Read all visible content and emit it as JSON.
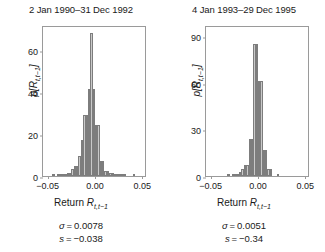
{
  "figure": {
    "background": "#ffffff",
    "bar_fill": "#c9c9c9",
    "bar_edge": "#7d7d7d",
    "axis_color": "#9a9a9a"
  },
  "panels": [
    {
      "title": "2 Jan 1990–31 Dec 1992",
      "ylabel_p": "p",
      "ylabel_r": "[R",
      "ylabel_sub": "t,t−1",
      "ylabel_close": "]",
      "xlabel_main": "Return ",
      "xlabel_r": "R",
      "xlabel_sub": "t,t−1",
      "sigma_line": "σ = 0.0078",
      "sigma_symbol": "σ",
      "sigma_value": "0.0078",
      "skew_symbol": "s",
      "skew_value": "−0.038",
      "yticks": [
        "0",
        "20",
        "40",
        "60"
      ],
      "xticks": [
        "−0.05",
        "0.00",
        "0.05"
      ]
    },
    {
      "title": "4 Jan 1993–29 Dec 1995",
      "ylabel_p": "p",
      "ylabel_r": "[R",
      "ylabel_sub": "t,t−1",
      "ylabel_close": "]",
      "xlabel_main": "Return ",
      "xlabel_r": "R",
      "xlabel_sub": "t,t−1",
      "sigma_line": "σ = 0.0051",
      "sigma_symbol": "σ",
      "sigma_value": "0.0051",
      "skew_symbol": "s",
      "skew_value": "−0.34",
      "yticks": [
        "0",
        "30",
        "60",
        "90"
      ],
      "xticks": [
        "−0.05",
        "0.00",
        "0.05"
      ]
    }
  ],
  "chart_data": [
    {
      "type": "bar",
      "title": "2 Jan 1990–31 Dec 1992",
      "xlabel": "Return R_{t,t-1}",
      "ylabel": "p[R_{t,t-1}]",
      "xlim": [
        -0.055,
        0.055
      ],
      "ylim": [
        0,
        72
      ],
      "yticks": [
        0,
        20,
        40,
        60
      ],
      "xticks": [
        -0.05,
        0.0,
        0.05
      ],
      "grid": false,
      "legend": "none",
      "bin_width": 0.0025,
      "bin_centers": [
        -0.04375,
        -0.04125,
        -0.03875,
        -0.03625,
        -0.03375,
        -0.03125,
        -0.02875,
        -0.02625,
        -0.02375,
        -0.02125,
        -0.01875,
        -0.01625,
        -0.01375,
        -0.01125,
        -0.00875,
        -0.00625,
        -0.00375,
        -0.00125,
        0.00125,
        0.00375,
        0.00625,
        0.00875,
        0.01125,
        0.01375,
        0.01625,
        0.01875,
        0.02125,
        0.02375,
        0.02625,
        0.02875,
        0.03125,
        0.04125
      ],
      "values": [
        0.4,
        0,
        0.9,
        0.9,
        0.4,
        0.9,
        1.4,
        1.4,
        3.3,
        4.6,
        4.6,
        9.5,
        17.3,
        29.0,
        29.0,
        41.5,
        68.0,
        41.5,
        24.5,
        24.5,
        7.2,
        7.2,
        2.4,
        2.4,
        1.3,
        1.3,
        0.6,
        0.6,
        0.4,
        0.4,
        0.3,
        0.3
      ],
      "annotations": [
        "σ = 0.0078",
        "s = −0.038"
      ]
    },
    {
      "type": "bar",
      "title": "4 Jan 1993–29 Dec 1995",
      "xlabel": "Return R_{t,t-1}",
      "ylabel": "p[R_{t,t-1}]",
      "xlim": [
        -0.055,
        0.055
      ],
      "ylim": [
        0,
        97
      ],
      "yticks": [
        0,
        30,
        60,
        90
      ],
      "xticks": [
        -0.05,
        0.0,
        0.05
      ],
      "grid": false,
      "legend": "none",
      "bin_width": 0.0025,
      "bin_centers": [
        -0.03125,
        -0.02625,
        -0.02375,
        -0.02125,
        -0.01875,
        -0.01625,
        -0.01375,
        -0.01125,
        -0.00875,
        -0.00625,
        -0.00375,
        -0.00125,
        0.00125,
        0.00375,
        0.00625,
        0.00875,
        0.01125,
        0.01375,
        0.02125
      ],
      "values": [
        0.6,
        0.6,
        1.2,
        1.2,
        2.4,
        4.2,
        7.0,
        7.0,
        24.0,
        24.0,
        85.0,
        85.0,
        61.0,
        61.0,
        17.0,
        17.0,
        4.2,
        4.2,
        0.5
      ],
      "annotations": [
        "σ = 0.0051",
        "s = −0.34"
      ]
    }
  ]
}
